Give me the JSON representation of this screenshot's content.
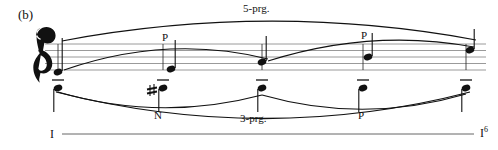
{
  "figure": {
    "label": "(b)",
    "type": "schenkerian-voice-leading-graph"
  },
  "staff": {
    "clef": "treble-clef",
    "line_count": 5,
    "top_y": 44,
    "line_spacing": 6.5,
    "left_x": 45,
    "right_x": 486
  },
  "upper_voice": {
    "stem_direction": "up",
    "notes": [
      {
        "index": 0,
        "x": 58,
        "y": 72,
        "label": ""
      },
      {
        "index": 1,
        "x": 171,
        "y": 69,
        "label": "P"
      },
      {
        "index": 2,
        "x": 262,
        "y": 62,
        "label": ""
      },
      {
        "index": 3,
        "x": 368,
        "y": 57,
        "label": "P"
      },
      {
        "index": 4,
        "x": 470,
        "y": 50,
        "label": ""
      }
    ]
  },
  "lower_voice": {
    "stem_direction": "down",
    "notes": [
      {
        "index": 0,
        "x": 58,
        "y": 88,
        "tenuto": true,
        "accidental": "",
        "label": ""
      },
      {
        "index": 1,
        "x": 163,
        "y": 88,
        "tenuto": true,
        "accidental": "sharp",
        "label": "N"
      },
      {
        "index": 2,
        "x": 262,
        "y": 88,
        "tenuto": true,
        "accidental": "",
        "label": ""
      },
      {
        "index": 3,
        "x": 363,
        "y": 88,
        "tenuto": true,
        "accidental": "",
        "label": "P"
      },
      {
        "index": 4,
        "x": 466,
        "y": 88,
        "tenuto": true,
        "accidental": "",
        "label": ""
      }
    ]
  },
  "slurs": {
    "upper_outer_label": "5-prg.",
    "lower_outer_label": "3-prg.",
    "upper_inner_labels": [
      "P",
      "P"
    ],
    "lower_inner_labels": [
      "N",
      "P"
    ]
  },
  "harmonic_analysis": {
    "left": "I",
    "right": "I",
    "right_superscript": "6",
    "line_y": 134
  },
  "colors": {
    "ink": "#111111",
    "staff_line": "#8a8a8a",
    "background": "#ffffff"
  }
}
